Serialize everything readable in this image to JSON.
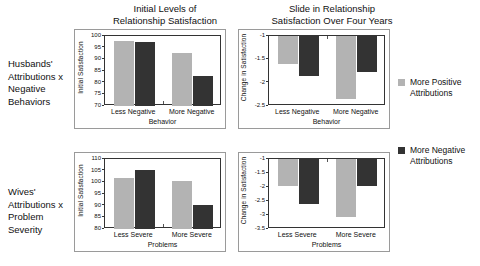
{
  "figure": {
    "column_titles": [
      "Initial Levels of\nRelationship Satisfaction",
      "Slide in Relationship\nSatisfaction Over Four Years"
    ],
    "row_labels": [
      "Husbands' Attributions x Negative Behaviors",
      "Wives' Attributions x Problem Severity"
    ]
  },
  "legend": {
    "position": "right",
    "items": [
      {
        "label": "More Positive Attributions",
        "color": "#b3b3b3",
        "key": "more-positive-attributions"
      },
      {
        "label": "More Negative Attributions",
        "color": "#333333",
        "key": "more-negative-attributions"
      }
    ]
  },
  "chart_data": [
    {
      "id": "husbands-initial-satisfaction",
      "type": "bar",
      "title": "Initial Levels of Relationship Satisfaction",
      "row": "Husbands' Attributions x Negative Behaviors",
      "xlabel": "Behavior",
      "ylabel": "Initial Satisfaction",
      "categories": [
        "Less Negative",
        "More Negative"
      ],
      "ylim": [
        70,
        100
      ],
      "yticks": [
        70,
        75,
        80,
        85,
        90,
        95,
        100
      ],
      "ytick_labels": [
        "70",
        "75",
        "80",
        "85",
        "90",
        "95",
        "100"
      ],
      "grid": false,
      "series": [
        {
          "name": "More Positive Attributions",
          "color": "#b3b3b3",
          "values": [
            98.0,
            92.7
          ]
        },
        {
          "name": "More Negative Attributions",
          "color": "#333333",
          "values": [
            97.4,
            83.0
          ]
        }
      ]
    },
    {
      "id": "husbands-change-in-satisfaction",
      "type": "bar",
      "title": "Slide in Relationship Satisfaction Over Four Years",
      "row": "Husbands' Attributions x Negative Behaviors",
      "xlabel": "Behavior",
      "ylabel": "Change in Satisfaction",
      "categories": [
        "Less Negative",
        "More Negative"
      ],
      "ylim": [
        -2.5,
        -1
      ],
      "yticks": [
        -1,
        -1.5,
        -2,
        -2.5
      ],
      "ytick_labels": [
        "-1",
        "-1.5",
        "-2",
        "-2.5"
      ],
      "grid": false,
      "series": [
        {
          "name": "More Positive Attributions",
          "color": "#b3b3b3",
          "values": [
            -1.6,
            -2.35
          ]
        },
        {
          "name": "More Negative Attributions",
          "color": "#333333",
          "values": [
            -1.85,
            -1.78
          ]
        }
      ]
    },
    {
      "id": "wives-initial-satisfaction",
      "type": "bar",
      "title": "Initial Levels of Relationship Satisfaction",
      "row": "Wives' Attributions x Problem Severity",
      "xlabel": "Problems",
      "ylabel": "Initial Satisfaction",
      "categories": [
        "Less Severe",
        "More Severe"
      ],
      "ylim": [
        80,
        110
      ],
      "yticks": [
        80,
        85,
        90,
        95,
        100,
        105,
        110
      ],
      "ytick_labels": [
        "80",
        "85",
        "90",
        "95",
        "100",
        "105",
        "110"
      ],
      "grid": false,
      "series": [
        {
          "name": "More Positive Attributions",
          "color": "#b3b3b3",
          "values": [
            102.0,
            100.5
          ]
        },
        {
          "name": "More Negative Attributions",
          "color": "#333333",
          "values": [
            105.3,
            90.3
          ]
        }
      ]
    },
    {
      "id": "wives-change-in-satisfaction",
      "type": "bar",
      "title": "Slide in Relationship Satisfaction Over Four Years",
      "row": "Wives' Attributions x Problem Severity",
      "xlabel": "Problems",
      "ylabel": "Change in Satisfaction",
      "categories": [
        "Less Severe",
        "More Severe"
      ],
      "ylim": [
        -3.5,
        -1
      ],
      "yticks": [
        -1,
        -1.5,
        -2,
        -2.5,
        -3,
        -3.5
      ],
      "ytick_labels": [
        "-1",
        "-1.5",
        "-2",
        "-2.5",
        "-3",
        "-3.5"
      ],
      "grid": false,
      "series": [
        {
          "name": "More Positive Attributions",
          "color": "#b3b3b3",
          "values": [
            -1.95,
            -3.07
          ]
        },
        {
          "name": "More Negative Attributions",
          "color": "#333333",
          "values": [
            -2.6,
            -1.97
          ]
        }
      ]
    }
  ]
}
